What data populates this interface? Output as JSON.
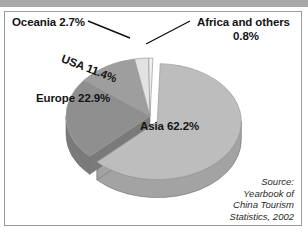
{
  "figure": {
    "type": "pie-chart-3d",
    "background_color": "#ffffff",
    "frame_color": "#9b9b9b",
    "top_band_color": "#a8a8a8"
  },
  "labels": {
    "oceania": "Oceania 2.7%",
    "africa_name": "Africa and others",
    "africa_value": "0.8%",
    "usa": "USA 11.4%",
    "europe": "Europe 22.9%",
    "asia": "Asia 62.2%"
  },
  "source": {
    "line1": "Source:",
    "line2": "Yearbook of",
    "line3": "China Tourism",
    "line4": "Statistics, 2002"
  },
  "chart_data": {
    "type": "pie",
    "title": "",
    "xlabel": "",
    "ylabel": "",
    "legend_position": "none",
    "grid": false,
    "unit": "%",
    "categories": [
      "Asia",
      "Europe",
      "USA",
      "Oceania",
      "Africa and others"
    ],
    "values": [
      62.2,
      22.9,
      11.4,
      2.7,
      0.8
    ],
    "data_labels": [
      "Asia 62.2%",
      "Europe 22.9%",
      "USA 11.4%",
      "Oceania 2.7%",
      "Africa and others 0.8%"
    ],
    "colors": [
      "#bdbdbd",
      "#8f8f8f",
      "#9e9e9e",
      "#e2e2e2",
      "#efefef"
    ],
    "side_colors": [
      "#a3a3a3",
      "#7a7a7a",
      "#878787",
      "#c9c9c9",
      "#d6d6d6"
    ],
    "exploded": [
      "Asia"
    ],
    "start_angle_deg": -88,
    "direction": "clockwise",
    "annotations": [
      {
        "label": "Oceania 2.7%",
        "leader_line": true
      },
      {
        "label": "Africa and others 0.8%",
        "leader_line": true
      }
    ],
    "source_note": "Source: Yearbook of China Tourism Statistics, 2002"
  }
}
